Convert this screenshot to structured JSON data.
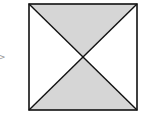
{
  "diagram": {
    "type": "square-with-diagonals",
    "arrow_glyph": ">",
    "square": {
      "x": 28,
      "y": 3,
      "width": 110,
      "height": 108
    },
    "shaded_regions": [
      "top-triangle",
      "bottom-triangle"
    ],
    "unshaded_regions": [
      "left-triangle",
      "right-triangle"
    ],
    "colors": {
      "stroke": "#111111",
      "shade": "#d6d6d6",
      "background": "#ffffff"
    }
  }
}
